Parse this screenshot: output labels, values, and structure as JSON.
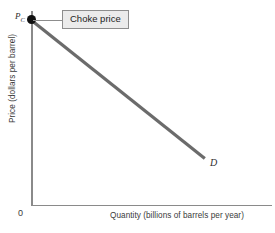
{
  "chart_data": {
    "type": "line",
    "title": "",
    "xlabel": "Quantity (billions of barrels per year)",
    "ylabel": "Price (dollars per barrel)",
    "origin_label": "0",
    "grid": false,
    "legend": "none",
    "xlim": [
      0,
      100
    ],
    "ylim": [
      0,
      100
    ],
    "axis_ticks": {
      "x": [],
      "y": []
    },
    "series": [
      {
        "name": "D",
        "curve_label": "D",
        "description": "Downward-sloping straight-line demand curve",
        "points": [
          {
            "x": 0,
            "y": 95
          },
          {
            "x": 72,
            "y": 24
          }
        ]
      }
    ],
    "annotations": [
      {
        "name": "choke-price-marker",
        "kind": "point-marker",
        "label": "P",
        "subscript": "C",
        "at": {
          "x": 0,
          "y": 95
        }
      },
      {
        "name": "choke-price-callout",
        "kind": "callout-box",
        "text": "Choke price",
        "points_to": {
          "x": 0,
          "y": 95
        }
      }
    ]
  },
  "figure": {
    "y_axis_label": "Price (dollars per barrel)",
    "x_axis_label": "Quantity (billions of barrels per year)",
    "origin": "0",
    "choke_price_symbol": "P",
    "choke_price_subscript": "C",
    "demand_curve_label": "D",
    "callout_text": "Choke price"
  },
  "colors": {
    "background": "#ffffff",
    "axis": "#8a8a8a",
    "demand_line": "#6b6b6b",
    "marker_dot": "#111111",
    "callout_fill": "#ebebeb",
    "callout_border": "#8d8d8d",
    "text": "#3b3b3b"
  }
}
